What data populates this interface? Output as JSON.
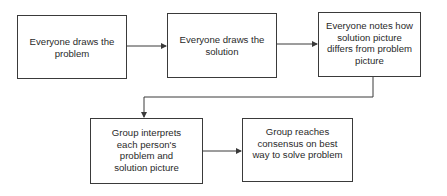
{
  "diagram": {
    "type": "flowchart",
    "nodes": [
      {
        "id": "n1",
        "label": "Everyone draws the problem"
      },
      {
        "id": "n2",
        "label": "Everyone draws the solution"
      },
      {
        "id": "n3",
        "label": "Everyone notes how solution picture differs from problem picture"
      },
      {
        "id": "n4",
        "label": "Group interprets each person's problem and solution picture"
      },
      {
        "id": "n5",
        "label": "Group reaches consensus on best way to solve problem"
      }
    ],
    "edges": [
      {
        "from": "n1",
        "to": "n2"
      },
      {
        "from": "n2",
        "to": "n3"
      },
      {
        "from": "n3",
        "to": "n4"
      },
      {
        "from": "n4",
        "to": "n5"
      }
    ],
    "colors": {
      "line": "#3a3a3a",
      "background": "#ffffff",
      "text": "#2a2a2a"
    }
  }
}
